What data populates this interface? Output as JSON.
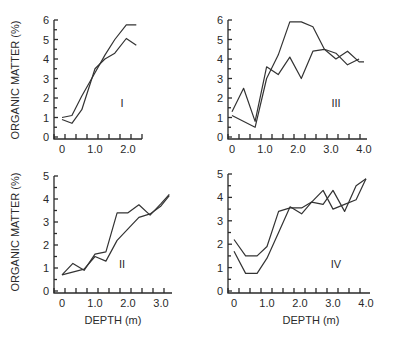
{
  "figure": {
    "ylabel": "ORGANIC MATTER (%)",
    "xlabel": "DEPTH (m)",
    "line_color": "#333333",
    "axis_color": "#2a2a2a"
  },
  "chart_data": [
    {
      "type": "line",
      "panel": "I",
      "title": "I",
      "xlabel": "",
      "ylabel": "ORGANIC MATTER (%)",
      "xticks": [
        "0",
        "1.0",
        "2.0"
      ],
      "yticks": [
        "0",
        "1",
        "2",
        "3",
        "4",
        "5",
        "6"
      ],
      "xlim": [
        -0.25,
        2.35
      ],
      "ylim": [
        0,
        6
      ],
      "grid": false,
      "series": [
        {
          "name": "core A",
          "x": [
            0.0,
            0.3,
            0.6,
            1.0,
            1.3,
            1.6,
            1.95,
            2.25
          ],
          "y": [
            1.0,
            1.1,
            2.1,
            3.3,
            4.2,
            5.0,
            5.75,
            5.75
          ]
        },
        {
          "name": "core B",
          "x": [
            0.0,
            0.3,
            0.6,
            1.0,
            1.3,
            1.6,
            1.95,
            2.25
          ],
          "y": [
            0.9,
            0.7,
            1.4,
            3.5,
            4.0,
            4.3,
            5.05,
            4.7
          ]
        }
      ]
    },
    {
      "type": "line",
      "panel": "III",
      "title": "III",
      "xlabel": "",
      "ylabel": "",
      "xticks": [
        "0",
        "1.0",
        "2.0",
        "3.0",
        "4.0"
      ],
      "yticks": [
        "0",
        "1",
        "2",
        "3",
        "4",
        "5",
        "6"
      ],
      "xlim": [
        -0.1,
        4.0
      ],
      "ylim": [
        0,
        6
      ],
      "grid": false,
      "series": [
        {
          "name": "core A",
          "x": [
            0.0,
            0.35,
            0.7,
            1.05,
            1.4,
            1.75,
            2.1,
            2.45,
            2.8,
            3.15,
            3.5,
            3.85,
            4.0
          ],
          "y": [
            1.3,
            2.5,
            0.8,
            3.6,
            3.2,
            4.1,
            3.0,
            4.4,
            4.5,
            4.0,
            4.4,
            3.85,
            3.85
          ]
        },
        {
          "name": "core B",
          "x": [
            0.0,
            0.7,
            1.05,
            1.4,
            1.75,
            2.1,
            2.45,
            2.8,
            3.15,
            3.5,
            3.85
          ],
          "y": [
            1.1,
            0.5,
            3.0,
            4.2,
            5.9,
            5.9,
            5.65,
            4.5,
            4.3,
            3.7,
            4.0
          ]
        }
      ]
    },
    {
      "type": "line",
      "panel": "II",
      "title": "II",
      "xlabel": "DEPTH (m)",
      "ylabel": "ORGANIC MATTER (%)",
      "xticks": [
        "0",
        "1.0",
        "2.0",
        "3.0"
      ],
      "yticks": [
        "0",
        "1",
        "2",
        "3",
        "4",
        "5"
      ],
      "xlim": [
        -0.2,
        3.3
      ],
      "ylim": [
        0,
        5
      ],
      "grid": false,
      "series": [
        {
          "name": "core A",
          "x": [
            0.0,
            0.33,
            0.67,
            1.0,
            1.33,
            1.67,
            2.0,
            2.33,
            2.67,
            3.0,
            3.25
          ],
          "y": [
            0.7,
            1.2,
            0.9,
            1.6,
            1.7,
            3.4,
            3.4,
            3.75,
            3.3,
            3.8,
            4.2
          ]
        },
        {
          "name": "core B",
          "x": [
            0.0,
            0.67,
            1.0,
            1.33,
            1.67,
            2.0,
            2.33,
            2.67,
            3.0,
            3.25
          ],
          "y": [
            0.7,
            0.95,
            1.5,
            1.3,
            2.2,
            2.7,
            3.2,
            3.35,
            3.7,
            4.15
          ]
        }
      ]
    },
    {
      "type": "line",
      "panel": "IV",
      "title": "IV",
      "xlabel": "DEPTH (m)",
      "ylabel": "",
      "xticks": [
        "0",
        "1.0",
        "2.0",
        "3.0",
        "4.0"
      ],
      "yticks": [
        "0",
        "1",
        "2",
        "3",
        "4",
        "5"
      ],
      "xlim": [
        -0.2,
        4.0
      ],
      "ylim": [
        0,
        5
      ],
      "grid": false,
      "series": [
        {
          "name": "core A",
          "x": [
            0.0,
            0.35,
            0.7,
            1.0,
            1.35,
            1.7,
            2.05,
            2.35,
            2.7,
            3.0,
            3.35,
            3.7,
            4.0
          ],
          "y": [
            2.2,
            1.5,
            1.5,
            1.9,
            3.4,
            3.55,
            3.55,
            3.8,
            3.7,
            4.3,
            3.4,
            4.5,
            4.8
          ]
        },
        {
          "name": "core B",
          "x": [
            0.0,
            0.35,
            0.7,
            1.0,
            1.35,
            1.7,
            2.05,
            2.35,
            2.7,
            3.0,
            3.35,
            3.7,
            4.0
          ],
          "y": [
            1.7,
            0.75,
            0.75,
            1.4,
            2.5,
            3.6,
            3.3,
            3.8,
            4.3,
            3.5,
            3.7,
            3.9,
            4.8
          ]
        }
      ]
    }
  ],
  "layout": {
    "panels": [
      {
        "x0": 54,
        "x1": 142,
        "y0": 137,
        "y1": 20,
        "xzero": 62,
        "xunit": 33,
        "label_x": 122,
        "label_y": 107
      },
      {
        "x0": 228,
        "x1": 367,
        "y0": 137,
        "y1": 20,
        "xzero": 232,
        "xunit": 33,
        "label_x": 336,
        "label_y": 107
      },
      {
        "x0": 54,
        "x1": 172,
        "y0": 291,
        "y1": 176,
        "xzero": 62,
        "xunit": 33,
        "label_x": 122,
        "label_y": 268
      },
      {
        "x0": 228,
        "x1": 370,
        "y0": 291,
        "y1": 174,
        "xzero": 234,
        "xunit": 33,
        "label_x": 336,
        "label_y": 268
      }
    ]
  }
}
